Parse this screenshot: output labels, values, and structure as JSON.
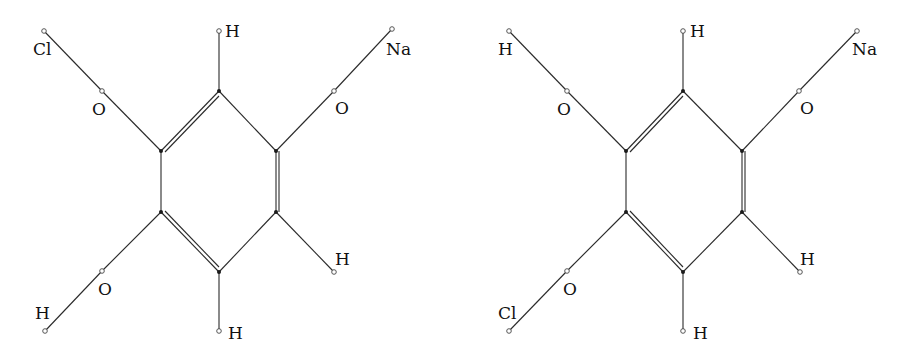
{
  "molecules": [
    {
      "name": "left-molecule",
      "ring_double_bonds": [
        "top-upperleft",
        "upperright-lowerright",
        "lowerleft-bottom"
      ],
      "labels": {
        "top_h": "H",
        "upper_left_terminal": "Cl",
        "upper_left_o": "O",
        "upper_right_terminal": "Na",
        "upper_right_o": "O",
        "lower_left_o": "O",
        "lower_left_terminal": "H",
        "lower_right_h": "H",
        "bottom_h": "H"
      }
    },
    {
      "name": "right-molecule",
      "ring_double_bonds": [
        "top-upperleft",
        "upperright-lowerright",
        "lowerleft-bottom"
      ],
      "labels": {
        "top_h": "H",
        "upper_left_terminal": "H",
        "upper_left_o": "O",
        "upper_right_terminal": "Na",
        "upper_right_o": "O",
        "lower_left_o": "O",
        "lower_left_terminal": "Cl",
        "lower_right_h": "H",
        "bottom_h": "H"
      }
    }
  ]
}
